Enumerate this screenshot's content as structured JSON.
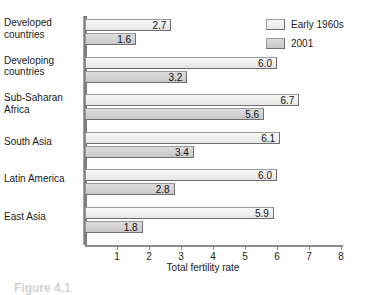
{
  "figure": {
    "title_remnant": "",
    "caption_remnant": "Figure 4.1"
  },
  "legend": {
    "position": "top-right",
    "entries": [
      {
        "label": "Early 1960s",
        "color": "#efefef"
      },
      {
        "label": "2001",
        "color": "#d2d2d2"
      }
    ]
  },
  "axis": {
    "xlabel": "Total fertility rate",
    "ticks": [
      "1",
      "2",
      "3",
      "4",
      "5",
      "6",
      "7",
      "8"
    ]
  },
  "chart_data": {
    "type": "bar",
    "orientation": "horizontal",
    "title": "",
    "xlabel": "Total fertility rate",
    "ylabel": "",
    "xlim": [
      0,
      8
    ],
    "grid": false,
    "legend_position": "top-right",
    "categories": [
      "Developed countries",
      "Developing countries",
      "Sub-Saharan Africa",
      "South Asia",
      "Latin America",
      "East Asia"
    ],
    "series": [
      {
        "name": "Early 1960s",
        "color": "#efefef",
        "values": [
          2.7,
          6.0,
          6.7,
          6.1,
          6.0,
          5.9
        ]
      },
      {
        "name": "2001",
        "color": "#d2d2d2",
        "values": [
          1.6,
          3.2,
          5.6,
          3.4,
          2.8,
          1.8
        ]
      }
    ],
    "value_labels": [
      [
        "2.7",
        "6.0",
        "6.7",
        "6.1",
        "6.0",
        "5.9"
      ],
      [
        "1.6",
        "3.2",
        "5.6",
        "3.4",
        "2.8",
        "1.8"
      ]
    ]
  }
}
